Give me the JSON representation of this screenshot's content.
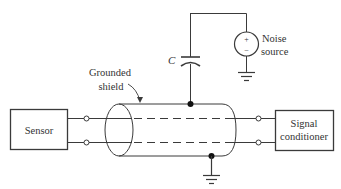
{
  "diagram": {
    "type": "circuit-schematic",
    "components": {
      "sensor": {
        "label": "Sensor"
      },
      "signal_conditioner": {
        "label_line1": "Signal",
        "label_line2": "conditioner"
      },
      "noise_source": {
        "label_line1": "Noise",
        "label_line2": "source",
        "plus": "+",
        "minus": "−"
      },
      "capacitor": {
        "label": "C"
      },
      "shield": {
        "label_line1": "Grounded",
        "label_line2": "shield"
      }
    },
    "colors": {
      "line": "#3a3a3a",
      "text": "#333333",
      "background": "#ffffff"
    }
  }
}
